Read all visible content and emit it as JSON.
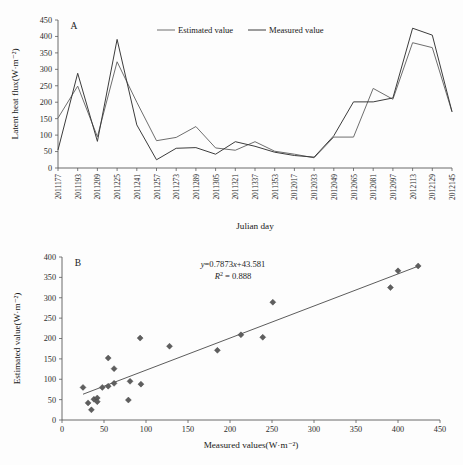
{
  "figure": {
    "background_color": "#fdfdfd",
    "axis_color": "#5a5a5a",
    "estimated_color": "#6e6e6e",
    "measured_color": "#3c3c3c",
    "marker_color": "#5e5e5e"
  },
  "panel_a": {
    "letter": "A",
    "legend": [
      {
        "label": "Estimated value",
        "color": "#6e6e6e"
      },
      {
        "label": "Measured value",
        "color": "#3c3c3c"
      }
    ],
    "chart_data": {
      "type": "line",
      "title": "",
      "xlabel": "Julian day",
      "ylabel": "Latent heat flux(W·m⁻²)",
      "ylim": [
        0,
        450
      ],
      "yticks": [
        0,
        50,
        100,
        150,
        200,
        250,
        300,
        350,
        400,
        450
      ],
      "grid": false,
      "legend_position": "top-center",
      "categories": [
        "2011177",
        "2011193",
        "2011209",
        "2011225",
        "2011241",
        "2011257",
        "2011273",
        "2011289",
        "2011305",
        "2011321",
        "2011337",
        "2011353",
        "2012017",
        "2012033",
        "2012049",
        "2012065",
        "2012081",
        "2012097",
        "2012113",
        "2012129",
        "2012145"
      ],
      "series": [
        {
          "name": "Estimated value",
          "color": "#6e6e6e",
          "values": [
            152,
            249,
            95,
            323,
            200,
            83,
            93,
            126,
            61,
            54,
            80,
            51,
            42,
            31,
            94,
            94,
            242,
            209,
            381,
            366,
            171
          ]
        },
        {
          "name": "Measured value",
          "color": "#3c3c3c",
          "values": [
            55,
            288,
            81,
            391,
            131,
            25,
            60,
            62,
            42,
            80,
            66,
            48,
            38,
            33,
            98,
            201,
            201,
            213,
            425,
            404,
            171
          ]
        }
      ]
    }
  },
  "panel_b": {
    "letter": "B",
    "annotations": {
      "equation": "y=0.7873x+43.581",
      "equation_y": "y",
      "equation_rest": "=0.7873",
      "equation_x": "x",
      "equation_tail": "+43.581",
      "r_symbol": "R",
      "r_exponent": "2",
      "r_value": " = 0.888"
    },
    "chart_data": {
      "type": "scatter",
      "title": "",
      "xlabel": "Measured values(W·m⁻²)",
      "ylabel": "Estimated value(W·m⁻²)",
      "xlim": [
        0,
        450
      ],
      "ylim": [
        0,
        400
      ],
      "xticks": [
        0,
        50,
        100,
        150,
        200,
        250,
        300,
        350,
        400,
        450
      ],
      "yticks": [
        0,
        50,
        100,
        150,
        200,
        250,
        300,
        350,
        400
      ],
      "grid": false,
      "legend_position": "none",
      "points": [
        {
          "x": 25,
          "y": 80
        },
        {
          "x": 31,
          "y": 42
        },
        {
          "x": 35,
          "y": 25
        },
        {
          "x": 38,
          "y": 51
        },
        {
          "x": 42,
          "y": 54
        },
        {
          "x": 42,
          "y": 45
        },
        {
          "x": 48,
          "y": 80
        },
        {
          "x": 55,
          "y": 152
        },
        {
          "x": 55,
          "y": 83
        },
        {
          "x": 62,
          "y": 126
        },
        {
          "x": 62,
          "y": 90
        },
        {
          "x": 79,
          "y": 49
        },
        {
          "x": 81,
          "y": 95
        },
        {
          "x": 93,
          "y": 201
        },
        {
          "x": 94,
          "y": 88
        },
        {
          "x": 128,
          "y": 181
        },
        {
          "x": 185,
          "y": 171
        },
        {
          "x": 213,
          "y": 209
        },
        {
          "x": 239,
          "y": 203
        },
        {
          "x": 251,
          "y": 289
        },
        {
          "x": 391,
          "y": 325
        },
        {
          "x": 400,
          "y": 366
        },
        {
          "x": 424,
          "y": 378
        }
      ],
      "fit": {
        "slope": 0.7873,
        "intercept": 43.581,
        "r_squared": 0.888,
        "x_start": 25,
        "x_end": 424
      }
    }
  }
}
